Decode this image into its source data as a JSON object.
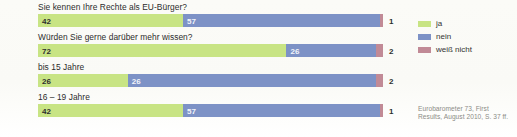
{
  "chart_data": {
    "type": "bar",
    "subtype": "stacked-horizontal-100",
    "title": "",
    "xlabel": "",
    "ylabel": "",
    "xlim": [
      0,
      100
    ],
    "grid": false,
    "legend_position": "top-right",
    "categories": [
      "Sie kennen Ihre Rechte als EU-Bürger?",
      "Würden Sie gerne darüber mehr wissen?",
      "bis 15 Jahre",
      "16 – 19 Jahre"
    ],
    "series": [
      {
        "name": "ja",
        "color": "#c8e484",
        "values": [
          42,
          72,
          26,
          42
        ]
      },
      {
        "name": "nein",
        "color": "#7d92c6",
        "values": [
          57,
          26,
          72,
          57
        ]
      },
      {
        "name": "weiß nicht",
        "color": "#c18a96",
        "values": [
          1,
          2,
          2,
          1
        ]
      }
    ]
  },
  "rows": [
    {
      "label": "Sie kennen Ihre Rechte als EU-Bürger?",
      "green": {
        "value": "42",
        "pct": 42
      },
      "blue": {
        "value": "57",
        "pct": 57
      },
      "pink": {
        "value": "1",
        "pct": 1
      }
    },
    {
      "label": "Würden Sie gerne darüber mehr wissen?",
      "green": {
        "value": "72",
        "pct": 72
      },
      "blue": {
        "value": "26",
        "pct": 26
      },
      "pink": {
        "value": "2",
        "pct": 2
      }
    },
    {
      "label": "bis 15 Jahre",
      "green": {
        "value": "26",
        "pct": 26
      },
      "blue": {
        "value": "26",
        "pct": 72
      },
      "pink": {
        "value": "2",
        "pct": 2
      }
    },
    {
      "label": "16 – 19 Jahre",
      "green": {
        "value": "42",
        "pct": 42
      },
      "blue": {
        "value": "57",
        "pct": 57
      },
      "pink": {
        "value": "1",
        "pct": 1
      }
    }
  ],
  "legend": {
    "items": [
      {
        "label": "ja",
        "color": "#c8e484"
      },
      {
        "label": "nein",
        "color": "#7d92c6"
      },
      {
        "label": "weiß nicht",
        "color": "#c18a96"
      }
    ]
  },
  "source": {
    "line1": "Eurobarometer 73, First",
    "line2": "Results, August 2010, S. 37 ff."
  },
  "colors": {
    "ja": "#c8e484",
    "nein": "#7d92c6",
    "weiss_nicht": "#c18a96",
    "text": "#2c2c2c",
    "source_text": "#8c8c86",
    "background": "#fdfdfb"
  }
}
